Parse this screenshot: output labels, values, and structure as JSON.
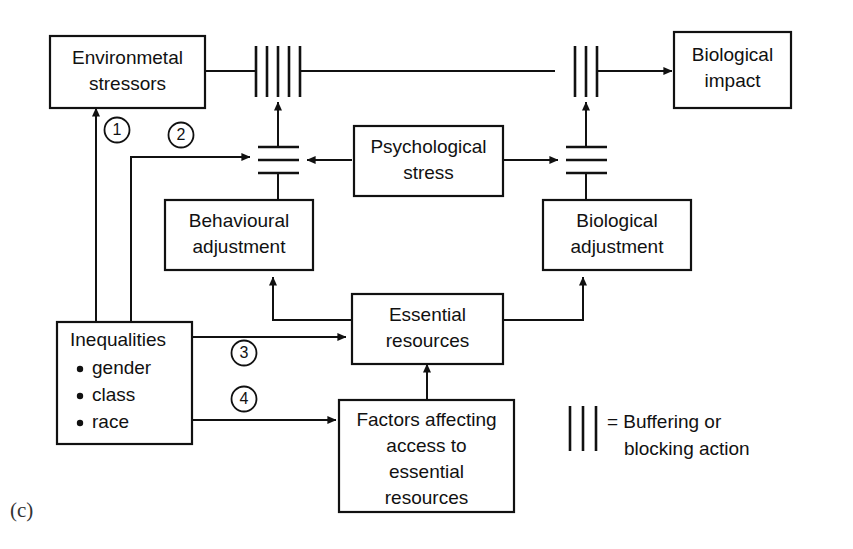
{
  "figure": {
    "panel_label": "(c)",
    "boxes": {
      "environmental_stressors": {
        "line1": "Environmetal",
        "line2": "stressors"
      },
      "biological_impact": {
        "line1": "Biological",
        "line2": "impact"
      },
      "psychological_stress": {
        "line1": "Psychological",
        "line2": "stress"
      },
      "behavioural_adjustment": {
        "line1": "Behavioural",
        "line2": "adjustment"
      },
      "biological_adjustment": {
        "line1": "Biological",
        "line2": "adjustment"
      },
      "essential_resources": {
        "line1": "Essential",
        "line2": "resources"
      },
      "factors_affecting_access": {
        "line1": "Factors affecting",
        "line2": "access to",
        "line3": "essential",
        "line4": "resources"
      },
      "inequalities": {
        "title": "Inequalities",
        "items": [
          "gender",
          "class",
          "race"
        ]
      }
    },
    "markers": {
      "one": "1",
      "two": "2",
      "three": "3",
      "four": "4"
    },
    "legend": {
      "symbol": "|||",
      "equals": "=",
      "line1": "= Buffering or",
      "line2": "blocking action"
    },
    "colors": {
      "stroke": "#111111",
      "background": "#ffffff",
      "panel_label": "#333333"
    }
  }
}
